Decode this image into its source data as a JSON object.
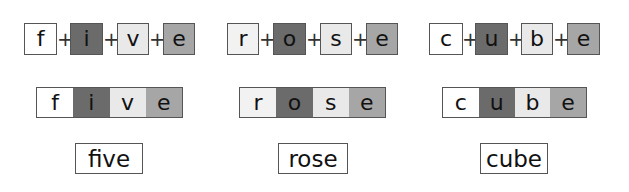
{
  "colors": {
    "white": "#ffffff",
    "light": "#e9e9e9",
    "very_light": "#f2f2f2",
    "dark": "#6b6b6b",
    "mid": "#a6a6a6",
    "border": "#555555"
  },
  "plus_symbol": "+",
  "words": [
    {
      "word": "five",
      "letters": [
        {
          "char": "f",
          "shade": "white"
        },
        {
          "char": "i",
          "shade": "dark"
        },
        {
          "char": "v",
          "shade": "light"
        },
        {
          "char": "e",
          "shade": "mid"
        }
      ]
    },
    {
      "word": "rose",
      "letters": [
        {
          "char": "r",
          "shade": "very_light"
        },
        {
          "char": "o",
          "shade": "dark"
        },
        {
          "char": "s",
          "shade": "light"
        },
        {
          "char": "e",
          "shade": "mid"
        }
      ]
    },
    {
      "word": "cube",
      "letters": [
        {
          "char": "c",
          "shade": "white"
        },
        {
          "char": "u",
          "shade": "dark"
        },
        {
          "char": "b",
          "shade": "light"
        },
        {
          "char": "e",
          "shade": "mid"
        }
      ]
    }
  ]
}
